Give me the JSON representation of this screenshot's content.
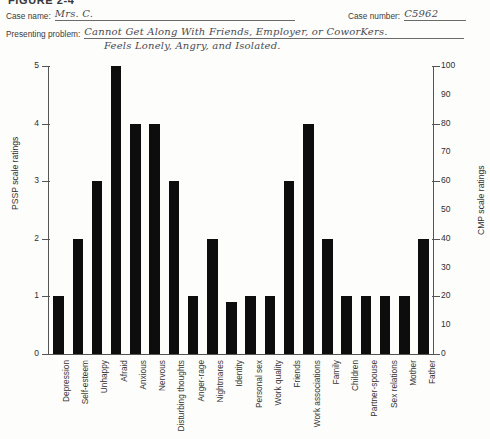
{
  "figure": {
    "title": "FIGURE 2-4"
  },
  "form": {
    "case_name_label": "Case name:",
    "case_name_value": "Mrs. C.",
    "case_number_label": "Case number:",
    "case_number_value": "C5962",
    "presenting_problem_label": "Presenting problem:",
    "presenting_problem_line1": "Cannot Get Along With Friends, Employer, or CoworKers.",
    "presenting_problem_line2": "Feels Lonely, Angry, and Isolated."
  },
  "chart_data": {
    "type": "bar",
    "title": "",
    "xlabel": "",
    "ylabel": "PSSP scale ratings",
    "y2label": "CMP scale ratings",
    "ylim": [
      0,
      5
    ],
    "y2lim": [
      0,
      100
    ],
    "yticks": [
      0,
      1,
      2,
      3,
      4,
      5
    ],
    "y2ticks": [
      0,
      10,
      20,
      30,
      40,
      50,
      60,
      70,
      80,
      90,
      100
    ],
    "y2_major_ticks": [
      0,
      20,
      40,
      60,
      80,
      100
    ],
    "grid": false,
    "legend": null,
    "bar_color": "#0d0d0d",
    "categories": [
      "Depression",
      "Self-esteem",
      "Unhappy",
      "Afraid",
      "Anxious",
      "Nervous",
      "Disturbing thoughts",
      "Anger-rage",
      "Nightmares",
      "Identity",
      "Personal sex",
      "Work quality",
      "Friends",
      "Work associations",
      "Family",
      "Children",
      "Partner-spouse",
      "Sex relations",
      "Mother",
      "Father"
    ],
    "values": [
      1,
      2,
      3,
      5,
      4,
      4,
      3,
      1,
      2,
      0.9,
      1,
      1,
      3,
      4,
      2,
      1,
      1,
      1,
      1,
      2
    ]
  }
}
